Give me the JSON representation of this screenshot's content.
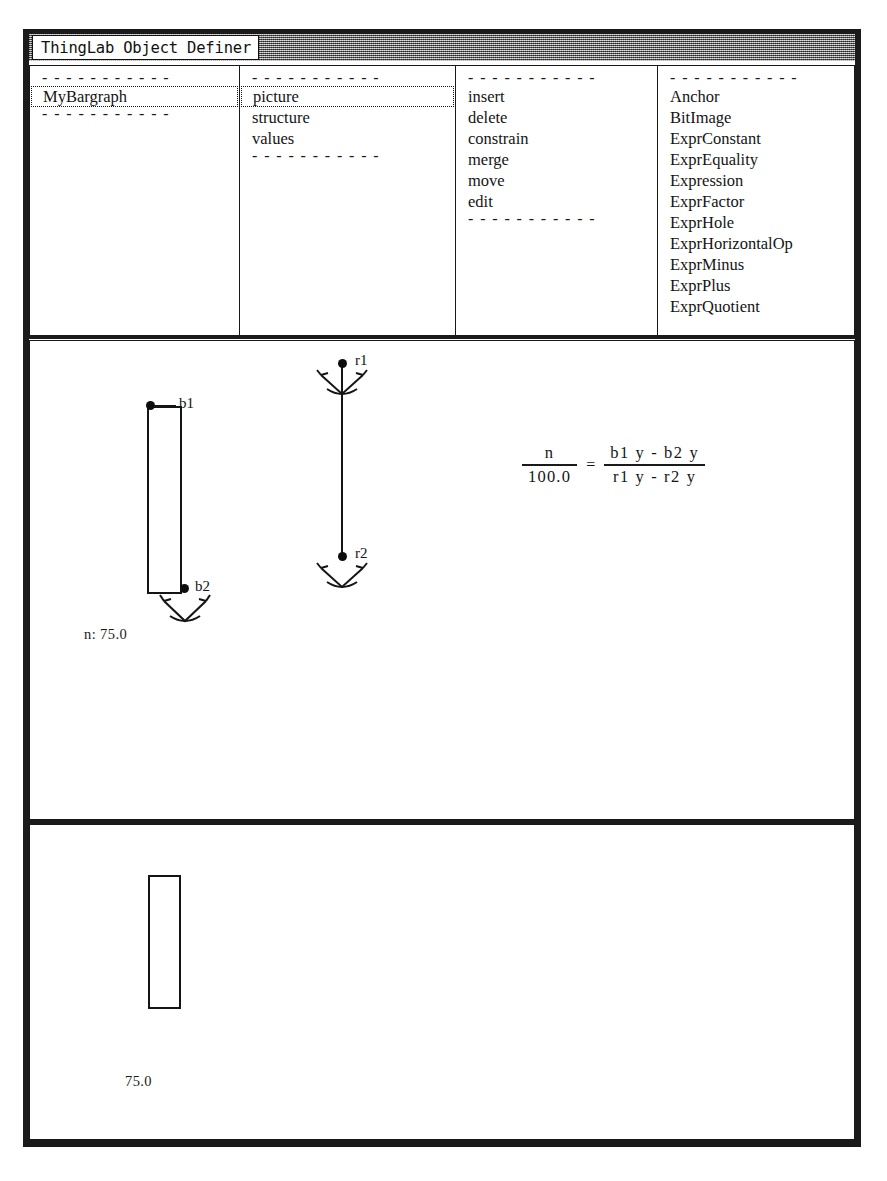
{
  "window": {
    "title": "ThingLab Object Definer",
    "accent_color": "#8d8d8d",
    "ink_color": "#151515"
  },
  "panes": {
    "instances": {
      "name": "instance-list",
      "separator": "- - - - - - - - - - -",
      "items": [
        {
          "label": "MyBargraph",
          "selected": true
        }
      ]
    },
    "aspects": {
      "name": "aspect-list",
      "separator": "- - - - - - - - - - -",
      "items": [
        {
          "label": "picture",
          "selected": true
        },
        {
          "label": "structure",
          "selected": false
        },
        {
          "label": "values",
          "selected": false
        }
      ]
    },
    "actions": {
      "name": "action-list",
      "separator": "- - - - - - - - - - -",
      "items": [
        {
          "label": "insert",
          "selected": false
        },
        {
          "label": "delete",
          "selected": false
        },
        {
          "label": "constrain",
          "selected": false
        },
        {
          "label": "merge",
          "selected": false
        },
        {
          "label": "move",
          "selected": false
        },
        {
          "label": "edit",
          "selected": false
        }
      ]
    },
    "classes": {
      "name": "class-list",
      "separator": "- - - - - - - - - - -",
      "items": [
        {
          "label": "Anchor",
          "selected": false
        },
        {
          "label": "BitImage",
          "selected": false
        },
        {
          "label": "ExprConstant",
          "selected": false
        },
        {
          "label": "ExprEquality",
          "selected": false
        },
        {
          "label": "Expression",
          "selected": false
        },
        {
          "label": "ExprFactor",
          "selected": false
        },
        {
          "label": "ExprHole",
          "selected": false
        },
        {
          "label": "ExprHorizontalOp",
          "selected": false
        },
        {
          "label": "ExprMinus",
          "selected": false
        },
        {
          "label": "ExprPlus",
          "selected": false
        },
        {
          "label": "ExprQuotient",
          "selected": false
        }
      ]
    }
  },
  "picture_view": {
    "bargraph": {
      "points": [
        {
          "id": "b1",
          "label": "b1",
          "anchored": false
        },
        {
          "id": "b2",
          "label": "b2",
          "anchored": true
        }
      ],
      "value_label": "n: 75.0"
    },
    "reference_line": {
      "points": [
        {
          "id": "r1",
          "label": "r1",
          "anchored": true
        },
        {
          "id": "r2",
          "label": "r2",
          "anchored": true
        }
      ]
    },
    "equation": {
      "left_numerator": "n",
      "left_denominator": "100.0",
      "relation": "=",
      "right_numerator": "b1 y  -  b2 y",
      "right_denominator": "r1 y  -  r2 y"
    }
  },
  "preview_view": {
    "value_label": "75.0",
    "bar": {
      "filled": false
    }
  }
}
